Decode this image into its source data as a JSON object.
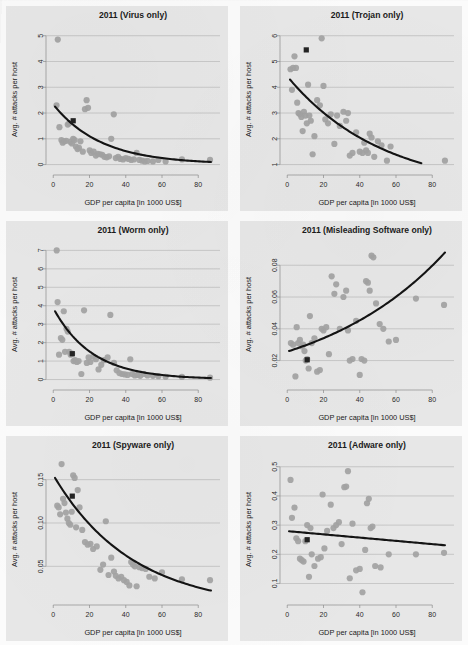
{
  "figure": {
    "panel_background": "#e7e7e7",
    "point_color": "#a3a3a3",
    "fit_color": "#141414",
    "highlight_color": "#232323",
    "gridline_color": "#b9b9b9",
    "axis_label_x": "GDP per capita [in 1000 US$]",
    "axis_label_y": "Avg. # attacks per host"
  },
  "chart_data": [
    {
      "type": "scatter",
      "title": "2011 (Virus only)",
      "xlabel": "GDP per capita [in 1000 US$]",
      "ylabel": "Avg. # attacks per host",
      "xlim": [
        -4,
        92
      ],
      "ylim": [
        -0.25,
        5.3
      ],
      "xticks": [
        0,
        20,
        40,
        60,
        80
      ],
      "yticks": [
        0,
        1,
        2,
        3,
        4,
        5
      ],
      "grid": true,
      "legend": "none",
      "x": [
        2.5,
        1.8,
        3.4,
        4.5,
        5.2,
        6.0,
        7.1,
        8.0,
        8.8,
        9.5,
        10.3,
        11.0,
        11.8,
        12.5,
        13.4,
        14.2,
        15.0,
        16.3,
        17.5,
        18.4,
        19.2,
        20.1,
        21.0,
        22.3,
        23.5,
        24.6,
        25.8,
        27.0,
        28.2,
        29.5,
        30.8,
        32.0,
        33.4,
        34.5,
        35.8,
        37.0,
        38.5,
        40.0,
        41.5,
        43.0,
        44.5,
        46.0,
        47.5,
        49.0,
        50.5,
        52.0,
        55.0,
        58.0,
        62.0,
        71.0,
        86.5
      ],
      "y": [
        4.85,
        2.3,
        1.45,
        0.95,
        0.85,
        0.9,
        0.92,
        1.55,
        1.6,
        0.88,
        0.82,
        1.0,
        0.95,
        0.7,
        0.6,
        0.65,
        0.9,
        0.5,
        2.15,
        2.5,
        2.2,
        0.55,
        0.45,
        0.5,
        0.35,
        0.42,
        0.4,
        0.38,
        0.3,
        0.28,
        0.32,
        1.0,
        1.95,
        0.25,
        0.3,
        0.22,
        0.2,
        0.25,
        0.22,
        0.18,
        0.2,
        0.45,
        0.18,
        0.15,
        0.12,
        0.14,
        0.12,
        0.18,
        0.12,
        0.2,
        0.18
      ],
      "highlight_point": {
        "x": 11.0,
        "y": 1.7,
        "label": "reference-country"
      },
      "fit": {
        "kind": "exponential-decay",
        "x0": 1.0,
        "y0": 2.25,
        "x1": 87.0,
        "y1": 0.1,
        "curvature": 0.038
      }
    },
    {
      "type": "scatter",
      "title": "2011 (Trojan only)",
      "xlabel": "GDP per capita [in 1000 US$]",
      "ylabel": "Avg. # attacks per host",
      "xlim": [
        -4,
        92
      ],
      "ylim": [
        0.75,
        6.3
      ],
      "xticks": [
        0,
        20,
        40,
        60,
        80
      ],
      "yticks": [
        1,
        2,
        3,
        4,
        5,
        6
      ],
      "grid": true,
      "legend": "none",
      "x": [
        1.8,
        2.6,
        3.2,
        4.0,
        4.8,
        5.5,
        6.2,
        7.0,
        7.8,
        8.5,
        9.2,
        10.0,
        10.8,
        11.5,
        12.2,
        13.0,
        14.0,
        15.0,
        16.5,
        18.0,
        19.0,
        20.0,
        21.0,
        22.5,
        24.0,
        26.0,
        27.5,
        29.0,
        31.0,
        32.5,
        33.5,
        34.5,
        36.0,
        38.0,
        40.0,
        41.5,
        42.5,
        43.5,
        44.5,
        45.5,
        46.5,
        48.0,
        50.0,
        52.0,
        55.0,
        57.0,
        87.0
      ],
      "y": [
        4.7,
        3.9,
        4.75,
        5.2,
        4.75,
        3.4,
        3.0,
        2.95,
        2.85,
        2.3,
        3.05,
        2.9,
        2.6,
        4.1,
        2.9,
        2.7,
        1.4,
        2.1,
        3.5,
        3.3,
        5.9,
        4.05,
        2.75,
        2.6,
        2.95,
        1.8,
        2.9,
        2.5,
        3.05,
        2.7,
        3.0,
        1.35,
        1.45,
        2.25,
        1.5,
        1.45,
        1.85,
        1.55,
        1.45,
        2.2,
        2.05,
        1.3,
        1.9,
        1.75,
        1.15,
        1.7,
        1.15
      ],
      "highlight_point": {
        "x": 10.5,
        "y": 5.45,
        "label": "reference-country"
      },
      "fit": {
        "kind": "exponential-decay",
        "x0": 1.5,
        "y0": 4.3,
        "x1": 74.0,
        "y1": 1.05,
        "curvature": 0.019
      }
    },
    {
      "type": "scatter",
      "title": "2011 (Worm only)",
      "xlabel": "GDP per capita [in 1000 US$]",
      "ylabel": "Avg. # attacks per host",
      "xlim": [
        -4,
        92
      ],
      "ylim": [
        -0.35,
        7.4
      ],
      "xticks": [
        0,
        20,
        40,
        60,
        80
      ],
      "yticks": [
        0,
        1,
        2,
        3,
        4,
        5,
        6,
        7
      ],
      "grid": true,
      "legend": "none",
      "x": [
        1.9,
        2.4,
        3.2,
        4.2,
        5.0,
        5.8,
        6.5,
        7.3,
        8.0,
        8.8,
        9.6,
        10.4,
        11.2,
        12.0,
        13.0,
        14.0,
        15.5,
        17.0,
        18.5,
        19.5,
        20.5,
        22.0,
        23.5,
        25.0,
        26.5,
        28.0,
        30.0,
        31.5,
        33.5,
        35.0,
        36.5,
        38.0,
        39.5,
        41.0,
        42.5,
        43.5,
        45.0,
        46.5,
        48.0,
        50.0,
        52.0,
        55.0,
        58.0,
        62.0,
        71.0,
        86.5
      ],
      "y": [
        7.0,
        4.2,
        1.35,
        2.25,
        2.15,
        3.7,
        1.5,
        2.75,
        2.6,
        1.5,
        1.35,
        1.4,
        1.0,
        1.05,
        0.95,
        1.0,
        0.3,
        3.75,
        0.9,
        1.2,
        0.95,
        1.25,
        1.1,
        0.55,
        0.8,
        1.05,
        1.2,
        3.5,
        0.9,
        0.5,
        0.35,
        0.3,
        0.28,
        0.25,
        1.1,
        0.3,
        0.22,
        0.25,
        0.2,
        0.3,
        0.22,
        0.2,
        0.18,
        0.15,
        0.14,
        0.1
      ],
      "highlight_point": {
        "x": 10.5,
        "y": 1.4,
        "label": "reference-country"
      },
      "fit": {
        "kind": "exponential-decay",
        "x0": 1.0,
        "y0": 3.7,
        "x1": 87.0,
        "y1": 0.08,
        "curvature": 0.047
      }
    },
    {
      "type": "scatter",
      "title": "2011 (Misleading Software only)",
      "xlabel": "GDP per capita [in 1000 US$]",
      "ylabel": "Avg. # attacks per host",
      "xlim": [
        -4,
        92
      ],
      "ylim": [
        0.004,
        0.094
      ],
      "xticks": [
        0,
        20,
        40,
        60,
        80
      ],
      "yticks": [
        0.02,
        0.04,
        0.06,
        0.08
      ],
      "ytick_labels": [
        "0.02",
        "0.04",
        "0.06",
        "0.08"
      ],
      "grid": true,
      "legend": "none",
      "x": [
        2.0,
        3.2,
        4.5,
        5.2,
        6.0,
        7.0,
        8.0,
        8.8,
        9.5,
        10.2,
        11.0,
        11.8,
        12.5,
        13.5,
        15.0,
        16.5,
        18.0,
        19.0,
        20.0,
        21.5,
        23.0,
        24.5,
        26.0,
        27.0,
        29.0,
        31.0,
        32.5,
        33.5,
        34.5,
        36.0,
        38.0,
        40.0,
        41.0,
        42.5,
        43.5,
        44.5,
        45.5,
        46.5,
        47.5,
        49.0,
        51.0,
        53.0,
        56.0,
        60.0,
        71.0,
        86.5
      ],
      "y": [
        0.031,
        0.03,
        0.01,
        0.041,
        0.031,
        0.033,
        0.029,
        0.03,
        0.026,
        0.02,
        0.021,
        0.015,
        0.048,
        0.031,
        0.034,
        0.013,
        0.014,
        0.04,
        0.039,
        0.041,
        0.024,
        0.073,
        0.062,
        0.068,
        0.04,
        0.06,
        0.064,
        0.039,
        0.02,
        0.021,
        0.045,
        0.011,
        0.021,
        0.02,
        0.07,
        0.069,
        0.064,
        0.086,
        0.085,
        0.056,
        0.043,
        0.04,
        0.032,
        0.033,
        0.059,
        0.055
      ],
      "highlight_point": {
        "x": 11.0,
        "y": 0.0205,
        "label": "reference-country"
      },
      "fit": {
        "kind": "exponential-growth",
        "x0": 1.0,
        "y0": 0.026,
        "x1": 87.0,
        "y1": 0.088,
        "curvature": 0.014
      }
    },
    {
      "type": "scatter",
      "title": "2011 (Spyware only)",
      "xlabel": "GDP per capita [in 1000 US$]",
      "ylabel": "Avg. # attacks per host",
      "xlim": [
        -4,
        92
      ],
      "ylim": [
        0.01,
        0.175
      ],
      "xticks": [
        0,
        20,
        40,
        60,
        80
      ],
      "yticks": [
        0.05,
        0.1,
        0.15
      ],
      "ytick_labels": [
        "0.05",
        "0.10",
        "0.15"
      ],
      "grid": true,
      "legend": "none",
      "x": [
        2.2,
        3.0,
        3.8,
        4.6,
        5.4,
        6.2,
        7.0,
        7.8,
        8.6,
        9.4,
        10.2,
        11.0,
        11.8,
        12.6,
        13.5,
        14.5,
        16.0,
        17.5,
        19.0,
        20.5,
        22.0,
        24.0,
        26.0,
        27.5,
        29.0,
        30.5,
        32.0,
        33.5,
        34.5,
        36.0,
        37.5,
        39.0,
        40.5,
        42.0,
        43.0,
        44.0,
        45.0,
        46.0,
        47.5,
        49.0,
        51.0,
        53.0,
        56.0,
        60.0,
        71.0,
        86.5
      ],
      "y": [
        0.12,
        0.118,
        0.11,
        0.168,
        0.128,
        0.123,
        0.112,
        0.105,
        0.1,
        0.098,
        0.113,
        0.155,
        0.152,
        0.095,
        0.138,
        0.118,
        0.092,
        0.078,
        0.075,
        0.076,
        0.07,
        0.073,
        0.046,
        0.052,
        0.102,
        0.04,
        0.06,
        0.044,
        0.039,
        0.036,
        0.038,
        0.034,
        0.032,
        0.028,
        0.055,
        0.052,
        0.05,
        0.027,
        0.049,
        0.048,
        0.047,
        0.038,
        0.036,
        0.043,
        0.035,
        0.034
      ],
      "highlight_point": {
        "x": 10.5,
        "y": 0.131,
        "label": "reference-country"
      },
      "fit": {
        "kind": "exponential-decay",
        "x0": 1.0,
        "y0": 0.152,
        "x1": 87.0,
        "y1": 0.022,
        "curvature": 0.023
      }
    },
    {
      "type": "scatter",
      "title": "2011 (Adware only)",
      "xlabel": "GDP per capita [in 1000 US$]",
      "ylabel": "Avg. # attacks per host",
      "xlim": [
        -4,
        92
      ],
      "ylim": [
        0.04,
        0.53
      ],
      "xticks": [
        0,
        20,
        40,
        60,
        80
      ],
      "yticks": [
        0.1,
        0.2,
        0.3,
        0.4,
        0.5
      ],
      "ytick_labels": [
        "0.1",
        "0.2",
        "0.3",
        "0.4",
        "0.5"
      ],
      "grid": true,
      "legend": "none",
      "x": [
        1.8,
        2.6,
        4.0,
        5.0,
        6.0,
        7.0,
        8.0,
        9.0,
        10.0,
        11.0,
        12.0,
        12.8,
        13.5,
        15.0,
        17.0,
        18.5,
        19.5,
        20.5,
        22.0,
        24.0,
        25.5,
        27.0,
        28.5,
        30.0,
        31.5,
        32.5,
        33.5,
        34.5,
        36.0,
        38.0,
        40.0,
        41.5,
        43.0,
        44.0,
        45.0,
        46.0,
        47.0,
        48.5,
        51.5,
        56.0,
        71.0,
        86.5
      ],
      "y": [
        0.455,
        0.325,
        0.36,
        0.255,
        0.245,
        0.185,
        0.18,
        0.175,
        0.245,
        0.3,
        0.123,
        0.29,
        0.2,
        0.16,
        0.185,
        0.19,
        0.405,
        0.22,
        0.28,
        0.37,
        0.29,
        0.3,
        0.31,
        0.235,
        0.43,
        0.432,
        0.485,
        0.118,
        0.305,
        0.145,
        0.15,
        0.07,
        0.215,
        0.375,
        0.39,
        0.29,
        0.295,
        0.16,
        0.155,
        0.2,
        0.2,
        0.205
      ],
      "highlight_point": {
        "x": 11.0,
        "y": 0.25,
        "label": "reference-country"
      },
      "fit": {
        "kind": "linear",
        "x0": 1.0,
        "y0": 0.279,
        "x1": 87.0,
        "y1": 0.231,
        "curvature": 0
      }
    }
  ]
}
